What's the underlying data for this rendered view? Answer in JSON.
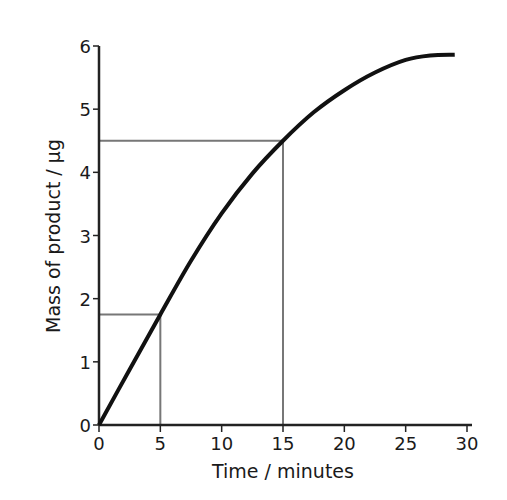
{
  "chart_data": {
    "type": "line",
    "title": "",
    "xlabel": "Time / minutes",
    "ylabel": "Mass of product / µg",
    "xlim": [
      0,
      30
    ],
    "ylim": [
      0,
      6
    ],
    "x_ticks": [
      0,
      5,
      10,
      15,
      20,
      25,
      30
    ],
    "y_ticks": [
      0,
      1,
      2,
      3,
      4,
      5,
      6
    ],
    "grid": false,
    "legend": null,
    "series": [
      {
        "name": "Mass of product",
        "color": "#111111",
        "x": [
          0,
          2.5,
          5,
          7.5,
          10,
          12.5,
          15,
          17.5,
          20,
          22.5,
          25,
          27,
          29
        ],
        "values": [
          0,
          0.88,
          1.75,
          2.6,
          3.35,
          3.98,
          4.5,
          4.95,
          5.3,
          5.58,
          5.78,
          5.85,
          5.86
        ]
      }
    ],
    "annotations": [
      {
        "type": "reference-lines",
        "x": 5,
        "y": 1.75,
        "color": "#777777"
      },
      {
        "type": "reference-lines",
        "x": 15,
        "y": 4.5,
        "color": "#777777"
      }
    ]
  }
}
